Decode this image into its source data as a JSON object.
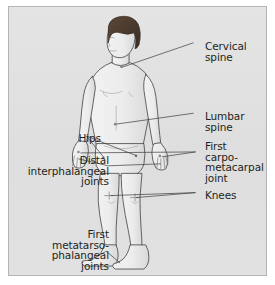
{
  "figure": {
    "panel": {
      "background_color": "#e2e2e2",
      "border_color": "#b4b4b4"
    },
    "colors": {
      "text": "#231f20",
      "leader_line": "#3a3a3a",
      "outline": "#4a4a4a",
      "skin_fill": "#ededed",
      "skin_shade": "#d6d6d6",
      "hair": "#4a3a30",
      "marker": "#7a7a7a"
    }
  },
  "labels": {
    "cervical_spine": "Cervical\nspine",
    "lumbar_spine": "Lumbar\nspine",
    "first_carpometacarpal_joint": "First\ncarpo-\nmetacarpal\njoint",
    "knees": "Knees",
    "hips": "Hips",
    "distal_interphalangeal_joints": "Distal\ninterphalangeal\njoints",
    "first_metatarsophalangeal_joints": "First\nmetatarso-\nphalangeal\njoints"
  },
  "annotations": [
    {
      "id": "cervical-spine",
      "label": "Cervical spine",
      "side": "right",
      "targets": [
        "neck"
      ]
    },
    {
      "id": "lumbar-spine",
      "label": "Lumbar spine",
      "side": "right",
      "targets": [
        "lower-back"
      ]
    },
    {
      "id": "first-carpometacarpal-joint",
      "label": "First carpo-metacarpal joint",
      "side": "right",
      "targets": [
        "left-thumb-base",
        "right-thumb-base"
      ]
    },
    {
      "id": "knees",
      "label": "Knees",
      "side": "right",
      "targets": [
        "left-knee",
        "right-knee"
      ]
    },
    {
      "id": "hips",
      "label": "Hips",
      "side": "left",
      "targets": [
        "left-hip",
        "right-hip"
      ]
    },
    {
      "id": "distal-interphalangeal-joints",
      "label": "Distal interphalangeal joints",
      "side": "left",
      "targets": [
        "left-hand-fingers",
        "right-hand-fingers"
      ]
    },
    {
      "id": "first-metatarsophalangeal-joints",
      "label": "First metatarsophalangeal joints",
      "side": "left",
      "targets": [
        "left-great-toe",
        "right-great-toe"
      ]
    }
  ]
}
